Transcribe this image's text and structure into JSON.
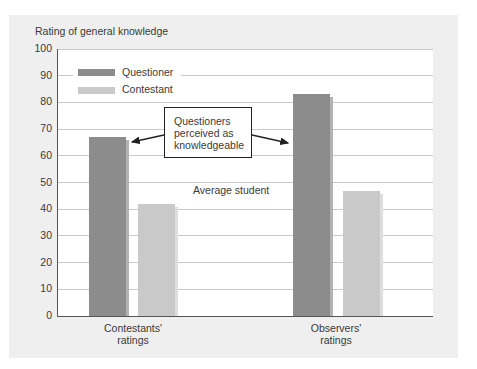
{
  "chart_data": {
    "type": "bar",
    "title": "Rating of general knowledge",
    "xlabel": "",
    "ylabel": "Rating of general knowledge",
    "ylim": [
      0,
      100
    ],
    "yticks": [
      0,
      10,
      20,
      30,
      40,
      50,
      60,
      70,
      80,
      90,
      100
    ],
    "grid": true,
    "legend_position": "upper-left",
    "categories": [
      "Contestants' ratings",
      "Observers' ratings"
    ],
    "category_lines": [
      [
        "Contestants'",
        "ratings"
      ],
      [
        "Observers'",
        "ratings"
      ]
    ],
    "series": [
      {
        "name": "Questioner",
        "color": "#8c8c8c",
        "shadow": "#b3b3b3",
        "values": [
          67,
          83
        ]
      },
      {
        "name": "Contestant",
        "color": "#c9c9c9",
        "shadow": "#dedede",
        "values": [
          42,
          47
        ]
      }
    ],
    "annotations": [
      {
        "text": [
          "Questioners",
          "perceived as",
          "knowledgeable"
        ],
        "type": "callout-box",
        "arrows_to": [
          "Questioner bar, Contestants' ratings",
          "Questioner bar, Observers' ratings"
        ]
      },
      {
        "text": "Average student",
        "type": "reference-label",
        "y": 50
      }
    ]
  },
  "colors": {
    "panel_bg": "#efefef",
    "plot_bg": "#ffffff",
    "gridline": "#c9c9c9",
    "axis": "#555555",
    "text": "#3a3a3a"
  }
}
